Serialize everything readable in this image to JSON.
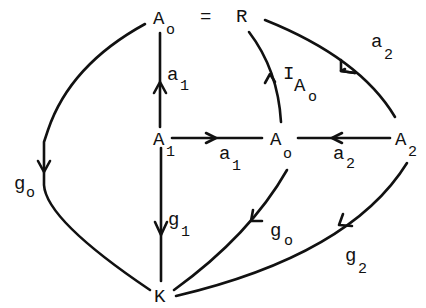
{
  "diagram": {
    "type": "commutative-diagram",
    "nodes": {
      "A0_top": {
        "base": "A",
        "sub": "o"
      },
      "equals": {
        "text": "="
      },
      "R": {
        "base": "R",
        "sub": ""
      },
      "A1": {
        "base": "A",
        "sub": "1"
      },
      "A0_mid": {
        "base": "A",
        "sub": "o"
      },
      "A2": {
        "base": "A",
        "sub": "2"
      },
      "K": {
        "base": "K",
        "sub": ""
      }
    },
    "edges": {
      "a1_up": {
        "base": "a",
        "sub": "1",
        "from": "A1",
        "to": "A0_top"
      },
      "a1_right": {
        "base": "a",
        "sub": "1",
        "from": "A1",
        "to": "A0_mid"
      },
      "a2_left": {
        "base": "a",
        "sub": "2",
        "from": "A2",
        "to": "A0_mid"
      },
      "a2_arc": {
        "base": "a",
        "sub": "2",
        "from": "A2",
        "to": "R"
      },
      "IA0": {
        "base": "I",
        "sub": "A",
        "subsub": "o",
        "from": "A0_mid",
        "to": "R"
      },
      "g0_left": {
        "base": "g",
        "sub": "o",
        "from": "A0_top",
        "to": "K"
      },
      "g1": {
        "base": "g",
        "sub": "1",
        "from": "A1",
        "to": "K"
      },
      "g0_mid": {
        "base": "g",
        "sub": "o",
        "from": "A0_mid",
        "to": "K"
      },
      "g2": {
        "base": "g",
        "sub": "2",
        "from": "A2",
        "to": "K"
      }
    }
  }
}
